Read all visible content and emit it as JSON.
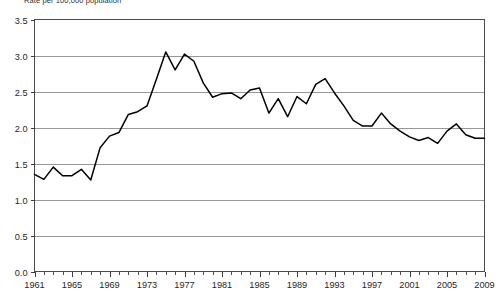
{
  "chart_data": {
    "type": "line",
    "title": "Rate per 100,000 population",
    "xlabel": "",
    "ylabel": "",
    "xlim": [
      1961,
      2009
    ],
    "ylim": [
      0.0,
      3.5
    ],
    "grid": true,
    "legend": "none",
    "y_ticks": [
      "0.0",
      "0.5",
      "1.0",
      "1.5",
      "2.0",
      "2.5",
      "3.0",
      "3.5"
    ],
    "y_tick_values": [
      0.0,
      0.5,
      1.0,
      1.5,
      2.0,
      2.5,
      3.0,
      3.5
    ],
    "x_ticks": [
      "1961",
      "1965",
      "1969",
      "1973",
      "1977",
      "1981",
      "1985",
      "1989",
      "1993",
      "1997",
      "2001",
      "2005",
      "2009"
    ],
    "x_tick_values": [
      1961,
      1965,
      1969,
      1973,
      1977,
      1981,
      1985,
      1989,
      1993,
      1997,
      2001,
      2005,
      2009
    ],
    "x": [
      1961,
      1962,
      1963,
      1964,
      1965,
      1966,
      1967,
      1968,
      1969,
      1970,
      1971,
      1972,
      1973,
      1974,
      1975,
      1976,
      1977,
      1978,
      1979,
      1980,
      1981,
      1982,
      1983,
      1984,
      1985,
      1986,
      1987,
      1988,
      1989,
      1990,
      1991,
      1992,
      1993,
      1994,
      1995,
      1996,
      1997,
      1998,
      1999,
      2000,
      2001,
      2002,
      2003,
      2004,
      2005,
      2006,
      2007,
      2008,
      2009
    ],
    "values": [
      1.35,
      1.28,
      1.45,
      1.33,
      1.33,
      1.42,
      1.27,
      1.72,
      1.88,
      1.93,
      2.18,
      2.22,
      2.3,
      2.67,
      3.05,
      2.8,
      3.02,
      2.92,
      2.62,
      2.42,
      2.47,
      2.48,
      2.4,
      2.52,
      2.55,
      2.2,
      2.4,
      2.15,
      2.43,
      2.33,
      2.6,
      2.68,
      2.48,
      2.3,
      2.1,
      2.02,
      2.02,
      2.2,
      2.05,
      1.95,
      1.87,
      1.82,
      1.86,
      1.78,
      1.95,
      2.05,
      1.9,
      1.85,
      1.85
    ],
    "series": [
      {
        "name": "Rate per 100,000 population",
        "color": "#000000",
        "values": [
          1.35,
          1.28,
          1.45,
          1.33,
          1.33,
          1.42,
          1.27,
          1.72,
          1.88,
          1.93,
          2.18,
          2.22,
          2.3,
          2.67,
          3.05,
          2.8,
          3.02,
          2.92,
          2.62,
          2.42,
          2.47,
          2.48,
          2.4,
          2.52,
          2.55,
          2.2,
          2.4,
          2.15,
          2.43,
          2.33,
          2.6,
          2.68,
          2.48,
          2.3,
          2.1,
          2.02,
          2.02,
          2.2,
          2.05,
          1.95,
          1.87,
          1.82,
          1.86,
          1.78,
          1.95,
          2.05,
          1.9,
          1.85,
          1.85
        ]
      }
    ],
    "colors": {
      "line": "#000000",
      "grid": "#8c8c8c",
      "frame": "#4a4a4a",
      "text": "#1f1f1f",
      "background": "#ffffff"
    }
  }
}
